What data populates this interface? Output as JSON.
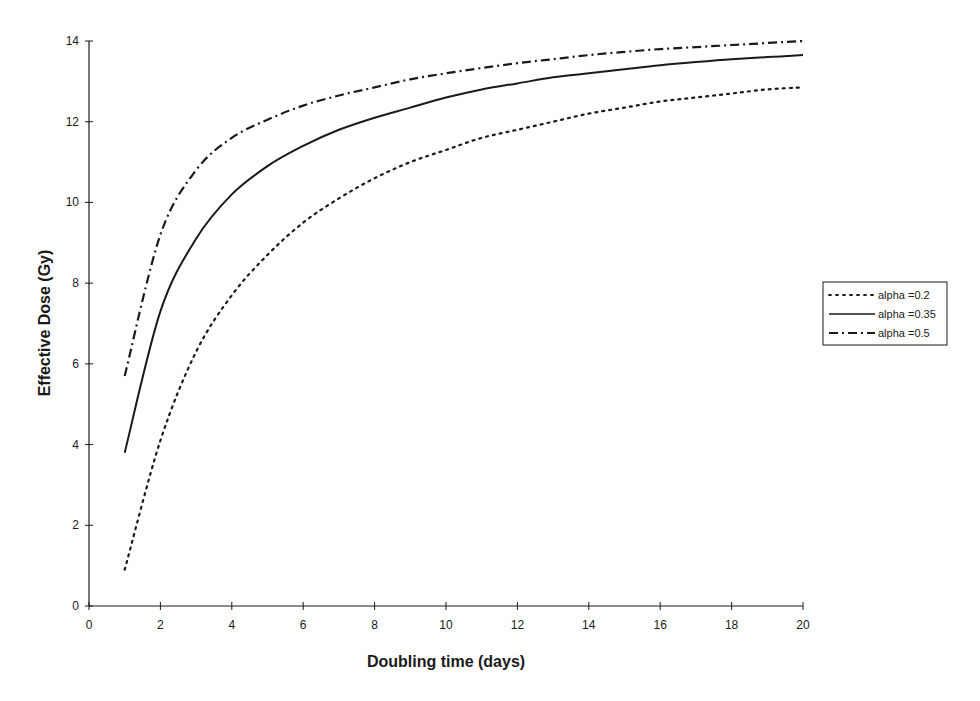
{
  "chart_data": {
    "type": "line",
    "title": "",
    "xlabel": "Doubling time (days)",
    "ylabel": "Effective Dose (Gy)",
    "xlim": [
      0,
      20
    ],
    "ylim": [
      0,
      14
    ],
    "xticks": [
      0,
      2,
      4,
      6,
      8,
      10,
      12,
      14,
      16,
      18,
      20
    ],
    "yticks": [
      0,
      2,
      4,
      6,
      8,
      10,
      12,
      14
    ],
    "grid": false,
    "legend_position": "right",
    "x": [
      1,
      2,
      3,
      4,
      5,
      6,
      7,
      8,
      9,
      10,
      11,
      12,
      13,
      14,
      15,
      16,
      17,
      18,
      19,
      20
    ],
    "series": [
      {
        "name": "alpha =0.2",
        "style": "dotted",
        "values": [
          0.9,
          4.1,
          6.3,
          7.7,
          8.7,
          9.5,
          10.1,
          10.6,
          11.0,
          11.3,
          11.6,
          11.8,
          12.0,
          12.2,
          12.35,
          12.5,
          12.6,
          12.7,
          12.8,
          12.85
        ]
      },
      {
        "name": "alpha =0.35",
        "style": "solid",
        "values": [
          3.8,
          7.3,
          9.1,
          10.2,
          10.9,
          11.4,
          11.8,
          12.1,
          12.35,
          12.6,
          12.8,
          12.95,
          13.1,
          13.2,
          13.3,
          13.4,
          13.48,
          13.55,
          13.6,
          13.65
        ]
      },
      {
        "name": "alpha =0.5",
        "style": "dash-dot",
        "values": [
          5.7,
          9.2,
          10.8,
          11.6,
          12.05,
          12.4,
          12.65,
          12.85,
          13.05,
          13.2,
          13.33,
          13.45,
          13.55,
          13.65,
          13.73,
          13.8,
          13.85,
          13.9,
          13.95,
          14.0
        ]
      }
    ]
  },
  "colors": {
    "ink": "#1a1a1a",
    "background": "#ffffff"
  }
}
